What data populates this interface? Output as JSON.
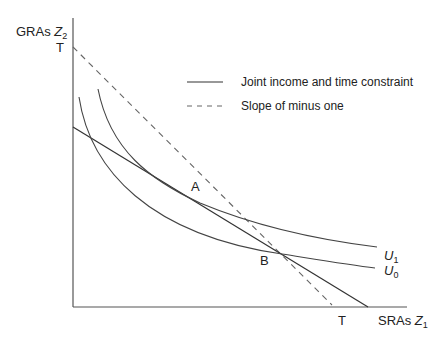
{
  "diagram": {
    "y_axis": {
      "label": "GRAs",
      "var": "Z",
      "sub": "2"
    },
    "x_axis": {
      "label": "SRAs",
      "var": "Z",
      "sub": "1"
    },
    "intercepts": {
      "y_T": "T",
      "x_T": "T"
    },
    "points": {
      "A": "A",
      "B": "B"
    },
    "curves": {
      "U1": {
        "var": "U",
        "sub": "1"
      },
      "U0": {
        "var": "U",
        "sub": "0"
      }
    },
    "legend": [
      {
        "style": "solid",
        "label": "Joint income and time constraint"
      },
      {
        "style": "dashed",
        "label": "Slope of minus one"
      }
    ],
    "colors": {
      "line": "#333333",
      "text": "#222222"
    }
  }
}
